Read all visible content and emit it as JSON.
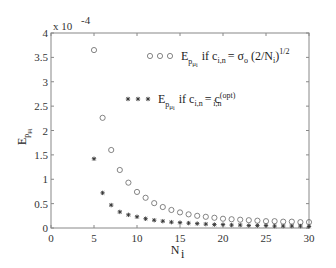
{
  "chart_data": {
    "type": "scatter",
    "title": "",
    "xlabel": "N_i",
    "ylabel": "E_{p_{μ_i}}",
    "y_multiplier": "x 10^-4",
    "xlim": [
      0,
      30
    ],
    "ylim": [
      0,
      4
    ],
    "xticks": [
      "0",
      "5",
      "10",
      "15",
      "20",
      "25",
      "30"
    ],
    "yticks": [
      "0",
      "0.5",
      "1",
      "1.5",
      "2",
      "2.5",
      "3",
      "3.5",
      "4"
    ],
    "grid": false,
    "legend_position": "upper right (inside)",
    "series": [
      {
        "name": "E_{p_{μ_i}} if c_{i,n} = σ_o (2/N_i)^{1/2}",
        "marker": "circle",
        "x": [
          5,
          6,
          7,
          8,
          9,
          10,
          11,
          12,
          13,
          14,
          15,
          16,
          17,
          18,
          19,
          20,
          21,
          22,
          23,
          24,
          25,
          26,
          27,
          28,
          29,
          30
        ],
        "values": [
          3.65,
          2.26,
          1.6,
          1.19,
          0.93,
          0.74,
          0.62,
          0.51,
          0.43,
          0.37,
          0.32,
          0.28,
          0.25,
          0.23,
          0.21,
          0.19,
          0.18,
          0.17,
          0.16,
          0.15,
          0.14,
          0.14,
          0.13,
          0.13,
          0.12,
          0.12
        ]
      },
      {
        "name": "E_{p_{μ_i}} if c_{i,n} = c_{i,n}^{(opt)}",
        "marker": "asterisk",
        "x": [
          5,
          6,
          7,
          8,
          9,
          10,
          11,
          12,
          13,
          14,
          15,
          16,
          17,
          18,
          19,
          20,
          21,
          22,
          23,
          24,
          25,
          26,
          27,
          28,
          29,
          30
        ],
        "values": [
          1.42,
          0.72,
          0.47,
          0.33,
          0.27,
          0.23,
          0.19,
          0.16,
          0.14,
          0.12,
          0.11,
          0.1,
          0.09,
          0.08,
          0.07,
          0.07,
          0.06,
          0.06,
          0.05,
          0.05,
          0.05,
          0.04,
          0.04,
          0.04,
          0.04,
          0.03
        ]
      }
    ]
  },
  "labels": {
    "multiplier_base": "x 10",
    "multiplier_exp": "-4",
    "xlabel_main": "N",
    "xlabel_sub": "i",
    "ylabel_main": "E",
    "legend1": {
      "E": "E",
      "sub": "p",
      "subsub": "μ",
      "subsubsub": "i",
      "cond": "if c",
      "cond_sub": "i,n",
      "rhs": "= σ",
      "rhs_sub": "o",
      "rhs2": "(2/N",
      "rhs2_sub": "i",
      "rhs2_end": ")",
      "exp": "1/2"
    },
    "legend2": {
      "E": "E",
      "sub": "p",
      "subsub": "μ",
      "subsubsub": "i",
      "cond": "if c",
      "cond_sub": "i,n",
      "rhs": "= c",
      "rhs_sub": "i,n",
      "rhs_sup": "(opt)"
    }
  }
}
